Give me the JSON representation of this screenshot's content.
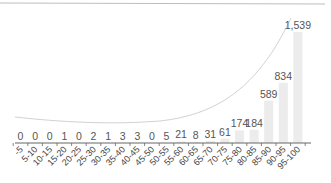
{
  "chart_data": {
    "type": "bar",
    "title": "",
    "xlabel": "",
    "ylabel": "",
    "categories": [
      "-5",
      "5-10",
      "10-15",
      "15-20",
      "20-25",
      "25-30",
      "30-35",
      "35-40",
      "40-45",
      "45-50",
      "50-55",
      "55-60",
      "60-65",
      "65-70",
      "70-75",
      "75-80",
      "80-85",
      "85-90",
      "90-95",
      "95-100"
    ],
    "values": [
      0,
      0,
      0,
      1,
      0,
      2,
      1,
      3,
      3,
      0,
      5,
      21,
      8,
      31,
      61,
      174,
      184,
      589,
      834,
      1539
    ],
    "value_labels": [
      "0",
      "0",
      "0",
      "1",
      "0",
      "2",
      "1",
      "3",
      "3",
      "0",
      "5",
      "21",
      "8",
      "31",
      "61",
      "174",
      "184",
      "589",
      "834",
      "1,539"
    ],
    "ylim": [
      0,
      1539
    ],
    "grid": false,
    "legend": null,
    "overlay": {
      "type": "line",
      "description": "smooth trend curve rising exponentially"
    },
    "colors": {
      "bar": "#ececec",
      "line": "#cfcfcf",
      "axis": "#666666",
      "top_rule": "#bdbdbd"
    }
  }
}
